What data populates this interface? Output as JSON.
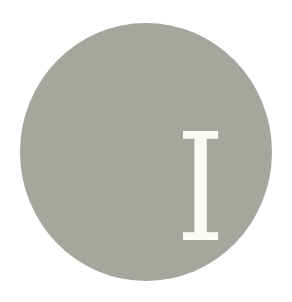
{
  "badge": {
    "letter": "I",
    "circle_color": "#a6a69f",
    "letter_color": "#fbfbf6",
    "background_color": "#ffffff"
  }
}
